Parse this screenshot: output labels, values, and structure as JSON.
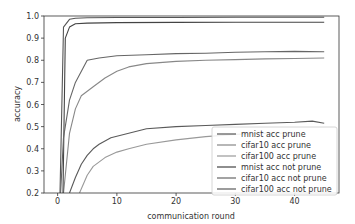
{
  "chart_data": {
    "type": "line",
    "title": "",
    "xlabel": "communication round",
    "ylabel": "accuracy",
    "xlim": [
      -2.3,
      47.5
    ],
    "ylim": [
      0.2,
      1.0
    ],
    "xticks": [
      0,
      10,
      20,
      30,
      40
    ],
    "yticks": [
      0.2,
      0.3,
      0.4,
      0.5,
      0.6,
      0.7,
      0.8,
      0.9,
      1.0
    ],
    "grid": false,
    "legend_position": "lower right",
    "series": [
      {
        "name": "mnist acc prune",
        "color": "#555555",
        "x": [
          0.4,
          1,
          2,
          3,
          5,
          10,
          20,
          30,
          45
        ],
        "y": [
          0.2,
          0.95,
          0.985,
          0.99,
          0.992,
          0.993,
          0.993,
          0.994,
          0.994
        ]
      },
      {
        "name": "cifar10 acc prune",
        "color": "#888888",
        "x": [
          1,
          2,
          3,
          4,
          6,
          8,
          10,
          12,
          15,
          20,
          25,
          30,
          35,
          40,
          45
        ],
        "y": [
          0.2,
          0.47,
          0.58,
          0.64,
          0.68,
          0.72,
          0.75,
          0.77,
          0.785,
          0.795,
          0.8,
          0.803,
          0.806,
          0.808,
          0.81
        ]
      },
      {
        "name": "cifar100 acc prune",
        "color": "#999999",
        "x": [
          3.7,
          5,
          6,
          8,
          10,
          12,
          15,
          20,
          25,
          30,
          35,
          40
        ],
        "y": [
          0.2,
          0.28,
          0.32,
          0.36,
          0.385,
          0.4,
          0.42,
          0.44,
          0.455,
          0.465,
          0.47,
          0.47
        ]
      },
      {
        "name": "mnist acc not prune",
        "color": "#444444",
        "x": [
          0.9,
          1.3,
          2,
          3,
          5,
          10,
          20,
          30,
          45
        ],
        "y": [
          0.2,
          0.9,
          0.95,
          0.965,
          0.968,
          0.97,
          0.971,
          0.972,
          0.972
        ]
      },
      {
        "name": "cifar10 acc not prune",
        "color": "#666666",
        "x": [
          0.5,
          1,
          2,
          3,
          5,
          7,
          10,
          15,
          20,
          25,
          30,
          35,
          40,
          45
        ],
        "y": [
          0.2,
          0.45,
          0.62,
          0.7,
          0.8,
          0.81,
          0.82,
          0.825,
          0.83,
          0.832,
          0.836,
          0.838,
          0.84,
          0.838
        ]
      },
      {
        "name": "cifar100 acc not prune",
        "color": "#5a5a5a",
        "x": [
          2,
          3,
          4,
          5,
          6,
          7,
          9,
          12,
          15,
          20,
          25,
          30,
          35,
          40,
          43,
          45
        ],
        "y": [
          0.2,
          0.27,
          0.33,
          0.37,
          0.4,
          0.42,
          0.45,
          0.47,
          0.49,
          0.5,
          0.505,
          0.51,
          0.515,
          0.52,
          0.525,
          0.515
        ]
      }
    ]
  }
}
